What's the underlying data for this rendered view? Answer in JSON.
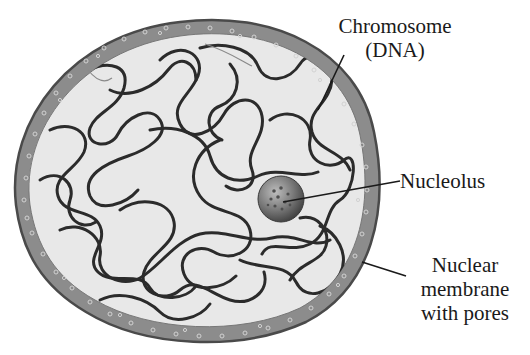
{
  "figure": {
    "type": "labeled-diagram"
  },
  "labels": {
    "chromosome": {
      "lines": [
        "Chromosome",
        "(DNA)"
      ]
    },
    "nucleolus": {
      "lines": [
        "Nucleolus"
      ]
    },
    "membrane": {
      "lines": [
        "Nuclear",
        "membrane",
        "with pores"
      ]
    }
  },
  "colors": {
    "membrane_outer": "#5a5a5a",
    "membrane_fill": "#8c8c8c",
    "nucleoplasm": "#e8e8e8",
    "chromatin": "#2b2b2b",
    "nucleolus": "#6f6f6f",
    "pores": "#cfcfcf",
    "leader_lines": "#1a1a1a",
    "text": "#1a1a1a"
  }
}
